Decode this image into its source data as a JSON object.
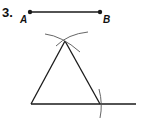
{
  "problem": {
    "number": "3.",
    "segment": {
      "start_label": "A",
      "end_label": "B"
    }
  },
  "colors": {
    "ink": "#1a1a1a",
    "arc": "#555555",
    "background": "#ffffff"
  }
}
